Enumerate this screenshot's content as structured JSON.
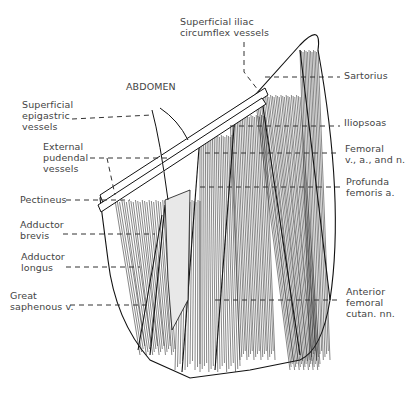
{
  "figure": {
    "region_label": "ABDOMEN",
    "labels_left": [
      {
        "id": "superficial-epigastric-vessels",
        "lines": [
          "Superficial",
          "epigastric",
          "vessels"
        ]
      },
      {
        "id": "external-pudendal-vessels",
        "lines": [
          "External",
          "pudendal",
          "vessels"
        ]
      },
      {
        "id": "pectineus",
        "lines": [
          "Pectineus"
        ]
      },
      {
        "id": "adductor-brevis",
        "lines": [
          "Adductor",
          "brevis"
        ]
      },
      {
        "id": "adductor-longus",
        "lines": [
          "Adductor",
          "longus"
        ]
      },
      {
        "id": "great-saphenous-v",
        "lines": [
          "Great",
          "saphenous v."
        ]
      }
    ],
    "labels_top": [
      {
        "id": "superficial-iliac-circumflex-vessels",
        "lines": [
          "Superficial iliac",
          "circumflex vessels"
        ]
      }
    ],
    "labels_right": [
      {
        "id": "sartorius",
        "lines": [
          "Sartorius"
        ]
      },
      {
        "id": "iliopsoas",
        "lines": [
          "Iliopsoas"
        ]
      },
      {
        "id": "femoral-vessels-nerve",
        "lines": [
          "Femoral",
          "v., a., and n."
        ]
      },
      {
        "id": "profunda-femoris-a",
        "lines": [
          "Profunda",
          "femoris a."
        ]
      },
      {
        "id": "anterior-femoral-cutan-nn",
        "lines": [
          "Anterior",
          "femoral",
          "cutan. nn."
        ]
      }
    ]
  }
}
